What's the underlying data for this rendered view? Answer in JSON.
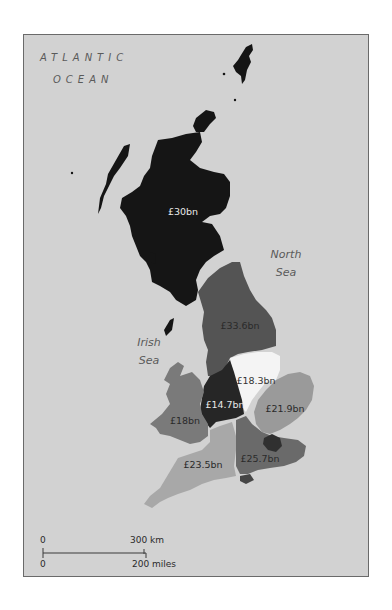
{
  "map": {
    "ocean_label_line1": "ATLANTIC",
    "ocean_label_line2": "OCEAN",
    "north_sea_line1": "North",
    "north_sea_line2": "Sea",
    "irish_sea_line1": "Irish",
    "irish_sea_line2": "Sea",
    "colors": {
      "background": "#d2d2d2",
      "frame_border": "#6a6a6a",
      "scotland": "#151515",
      "north_england": "#545454",
      "east_midlands": "#f4f4f4",
      "west_midlands": "#262626",
      "wales": "#7a7a7a",
      "east_england": "#9a9a9a",
      "south_west": "#a8a8a8",
      "south_east": "#6a6a6a",
      "london": "#303030"
    },
    "regions": [
      {
        "id": "scotland",
        "label": "£30bn",
        "label_color": "#e8e8e8"
      },
      {
        "id": "north_england",
        "label": "£33.6bn",
        "label_color": "#2a2a2a"
      },
      {
        "id": "east_midlands",
        "label": "£18.3bn",
        "label_color": "#333333"
      },
      {
        "id": "west_midlands",
        "label": "£14.7bn",
        "label_color": "#e8e8e8"
      },
      {
        "id": "wales",
        "label": "£18bn",
        "label_color": "#2a2a2a"
      },
      {
        "id": "east_england",
        "label": "£21.9bn",
        "label_color": "#2a2a2a"
      },
      {
        "id": "south_west",
        "label": "£23.5bn",
        "label_color": "#2a2a2a"
      },
      {
        "id": "south_east",
        "label": "£25.7bn",
        "label_color": "#2a2a2a"
      }
    ],
    "scale_bar": {
      "km_zero": "0",
      "km_label": "300 km",
      "miles_zero": "0",
      "miles_label": "200 miles"
    }
  }
}
